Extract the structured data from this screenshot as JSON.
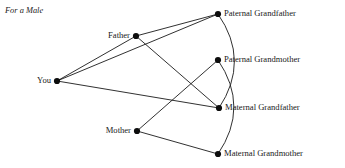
{
  "title": "For a Male",
  "chart_data": {
    "type": "diagram",
    "title": "For a Male",
    "diagram_kind": "kinship-graph",
    "nodes": [
      {
        "id": "you",
        "label": "You",
        "x": 57,
        "y": 81,
        "label_side": "left"
      },
      {
        "id": "father",
        "label": "Father",
        "x": 136,
        "y": 36,
        "label_side": "left"
      },
      {
        "id": "mother",
        "label": "Mother",
        "x": 137,
        "y": 131,
        "label_side": "left"
      },
      {
        "id": "paternal_grandfather",
        "label": "Paternal Grandfather",
        "x": 218,
        "y": 14,
        "label_side": "right"
      },
      {
        "id": "paternal_grandmother",
        "label": "Paternal Grandmother",
        "x": 218,
        "y": 60,
        "label_side": "right"
      },
      {
        "id": "maternal_grandfather",
        "label": "Maternal Grandfather",
        "x": 219,
        "y": 108,
        "label_side": "right"
      },
      {
        "id": "maternal_grandmother",
        "label": "Maternal Grandmother",
        "x": 218,
        "y": 154,
        "label_side": "right"
      }
    ],
    "edges": [
      {
        "from": "you",
        "to": "father",
        "kind": "line"
      },
      {
        "from": "you",
        "to": "paternal_grandfather",
        "kind": "line"
      },
      {
        "from": "you",
        "to": "maternal_grandfather",
        "kind": "line"
      },
      {
        "from": "father",
        "to": "paternal_grandfather",
        "kind": "line"
      },
      {
        "from": "father",
        "to": "maternal_grandfather",
        "kind": "line"
      },
      {
        "from": "mother",
        "to": "paternal_grandmother",
        "kind": "line"
      },
      {
        "from": "mother",
        "to": "maternal_grandmother",
        "kind": "line"
      },
      {
        "from": "paternal_grandfather",
        "to": "maternal_grandfather",
        "kind": "arc",
        "bulge": "right"
      },
      {
        "from": "paternal_grandmother",
        "to": "maternal_grandmother",
        "kind": "arc",
        "bulge": "right"
      }
    ],
    "colors": {
      "line": "#1a1a1a",
      "node": "#0d0d0d",
      "background": "#ffffff"
    }
  }
}
